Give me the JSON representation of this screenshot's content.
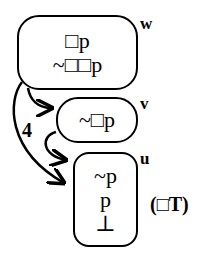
{
  "diagram": {
    "worlds": [
      {
        "id": "w",
        "label": "w",
        "formulas": [
          "□p",
          "~□□p"
        ]
      },
      {
        "id": "v",
        "label": "v",
        "formulas": [
          "~□p"
        ]
      },
      {
        "id": "u",
        "label": "u",
        "formulas": [
          "~p",
          "p",
          "⊥"
        ]
      }
    ],
    "edges": [
      {
        "from": "w",
        "to": "v"
      },
      {
        "from": "v",
        "to": "u"
      },
      {
        "from": "w",
        "to": "u",
        "label": "4"
      }
    ],
    "edge_label": "4",
    "rule_note": "(□T)"
  }
}
